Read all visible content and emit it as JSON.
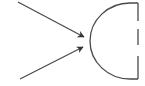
{
  "diagram": {
    "colors": {
      "stroke": "#4a4a4a",
      "arrowhead": "#333333",
      "background": "#ffffff"
    },
    "arrows": [
      {
        "name": "upper-arrow",
        "from": [
          18,
          2
        ],
        "to": [
          84,
          37
        ]
      },
      {
        "name": "lower-arrow",
        "from": [
          20,
          79
        ],
        "to": [
          83,
          47
        ]
      }
    ],
    "half_circle": {
      "top": [
        138,
        3
      ],
      "bottom": [
        138,
        79
      ],
      "leftmost_x": 90
    },
    "dashed_edge": {
      "x": 138,
      "segments": [
        [
          3,
          21
        ],
        [
          29,
          45
        ],
        [
          56,
          79
        ]
      ]
    }
  }
}
